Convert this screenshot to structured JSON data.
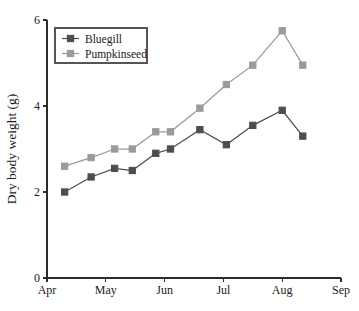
{
  "chart_data": {
    "type": "line",
    "title": "",
    "subtitle": "",
    "xlabel": "",
    "ylabel": "Dry body weight (g)",
    "x_tick_labels": [
      "Apr",
      "May",
      "Jun",
      "Jul",
      "Aug",
      "Sep"
    ],
    "y_tick_labels": [
      "0",
      "2",
      "4",
      "6"
    ],
    "y_ticks": [
      0,
      2,
      4,
      6
    ],
    "ylim": [
      0,
      6
    ],
    "xlim": [
      0,
      5
    ],
    "grid": false,
    "legend_position": "top-left",
    "x": [
      0.3,
      0.75,
      1.15,
      1.45,
      1.85,
      2.1,
      2.6,
      3.05,
      3.5,
      4.0,
      4.35
    ],
    "series": [
      {
        "name": "Bluegill",
        "color": "#4d4d4d",
        "marker": "square",
        "values": [
          2.0,
          2.35,
          2.55,
          2.5,
          2.9,
          3.0,
          3.45,
          3.1,
          3.55,
          3.9,
          3.3
        ]
      },
      {
        "name": "Pumpkinseed",
        "color": "#9a9a9a",
        "marker": "square",
        "values": [
          2.6,
          2.8,
          3.0,
          3.0,
          3.4,
          3.4,
          3.95,
          4.5,
          4.95,
          5.75,
          4.95
        ]
      }
    ],
    "legend": [
      {
        "label": "Bluegill",
        "color": "#4d4d4d"
      },
      {
        "label": "Pumpkinseed",
        "color": "#9a9a9a"
      }
    ],
    "axis_color": "#2b2b2b",
    "background": "#ffffff"
  },
  "geometry": {
    "plot_left": 47,
    "plot_right": 341,
    "plot_top": 20,
    "plot_bottom": 278,
    "month_span": 58.8,
    "marker_size": 6.2,
    "legend": {
      "x": 55,
      "y": 28,
      "w": 92,
      "h": 35
    }
  }
}
